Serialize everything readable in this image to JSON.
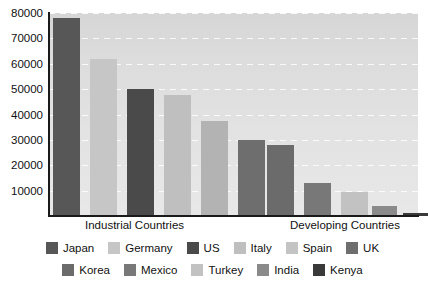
{
  "chart_data": {
    "type": "bar",
    "title": "",
    "xlabel": "",
    "ylabel": "",
    "ylim": [
      0,
      80000
    ],
    "ytick_step": 10000,
    "yticks": [
      "80000",
      "70000",
      "60000",
      "50000",
      "40000",
      "30000",
      "20000",
      "10000"
    ],
    "grid": true,
    "legend_position": "bottom",
    "group_labels": [
      "Industrial Countries",
      "Developing Countries"
    ],
    "categories": [
      "Japan",
      "Germany",
      "US",
      "Italy",
      "Spain",
      "UK",
      "Korea",
      "Mexico",
      "Turkey",
      "India",
      "Kenya"
    ],
    "values": [
      78000,
      62000,
      50000,
      47500,
      37500,
      30000,
      28000,
      13000,
      9500,
      4000,
      1200
    ],
    "colors": [
      "#575757",
      "#c6c6c6",
      "#4a4a4a",
      "#bfbfbf",
      "#b3b3b3",
      "#6e6e6e",
      "#6b6b6b",
      "#787878",
      "#c2c2c2",
      "#8a8a8a",
      "#3a3a3a"
    ],
    "groups": [
      "Industrial Countries",
      "Industrial Countries",
      "Industrial Countries",
      "Industrial Countries",
      "Industrial Countries",
      "Industrial Countries",
      "Developing Countries",
      "Developing Countries",
      "Developing Countries",
      "Developing Countries",
      "Developing Countries"
    ],
    "bar_geometry": [
      {
        "left": 4,
        "width": 27
      },
      {
        "left": 41,
        "width": 27
      },
      {
        "left": 78,
        "width": 27
      },
      {
        "left": 115,
        "width": 27
      },
      {
        "left": 152,
        "width": 27
      },
      {
        "left": 189,
        "width": 27
      },
      {
        "left": 218,
        "width": 27
      },
      {
        "left": 255,
        "width": 27
      },
      {
        "left": 292,
        "width": 27
      },
      {
        "left": 323,
        "width": 25
      },
      {
        "left": 354,
        "width": 25
      }
    ],
    "plot_background": "#dddddd",
    "axis_color": "#1a1a1a",
    "gridline_color": "#ffffff"
  },
  "legend": {
    "rows": [
      [
        {
          "label": "Japan",
          "color": "#575757"
        },
        {
          "label": "Germany",
          "color": "#c6c6c6"
        },
        {
          "label": "US",
          "color": "#4a4a4a"
        },
        {
          "label": "Italy",
          "color": "#bfbfbf"
        },
        {
          "label": "Spain",
          "color": "#c4c4c4"
        },
        {
          "label": "UK",
          "color": "#6e6e6e"
        }
      ],
      [
        {
          "label": "Korea",
          "color": "#6b6b6b"
        },
        {
          "label": "Mexico",
          "color": "#787878"
        },
        {
          "label": "Turkey",
          "color": "#c2c2c2"
        },
        {
          "label": "India",
          "color": "#8a8a8a"
        },
        {
          "label": "Kenya",
          "color": "#3a3a3a"
        }
      ]
    ]
  },
  "axis_labels": {
    "industrial": "Industrial Countries",
    "developing": "Developing Countries"
  }
}
